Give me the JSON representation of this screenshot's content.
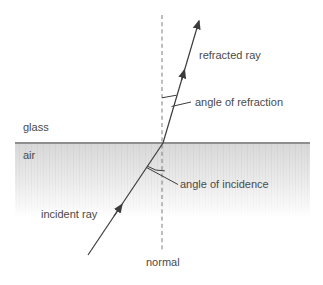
{
  "diagram": {
    "title_implied": "refraction at a glass-air interface",
    "labels": {
      "glass": "glass",
      "air": "air",
      "refracted_ray": "refracted ray",
      "angle_of_refraction": "angle of refraction",
      "angle_of_incidence": "angle of incidence",
      "incident_ray": "incident ray",
      "normal": "normal"
    },
    "colors": {
      "ray_line": "#3c3c3c",
      "interface_line": "#8f8f8f",
      "normal_dash": "#7d7d7d",
      "label_text": "#4a4a4a",
      "shading_top": "#d8d8d8",
      "background": "#ffffff"
    }
  }
}
